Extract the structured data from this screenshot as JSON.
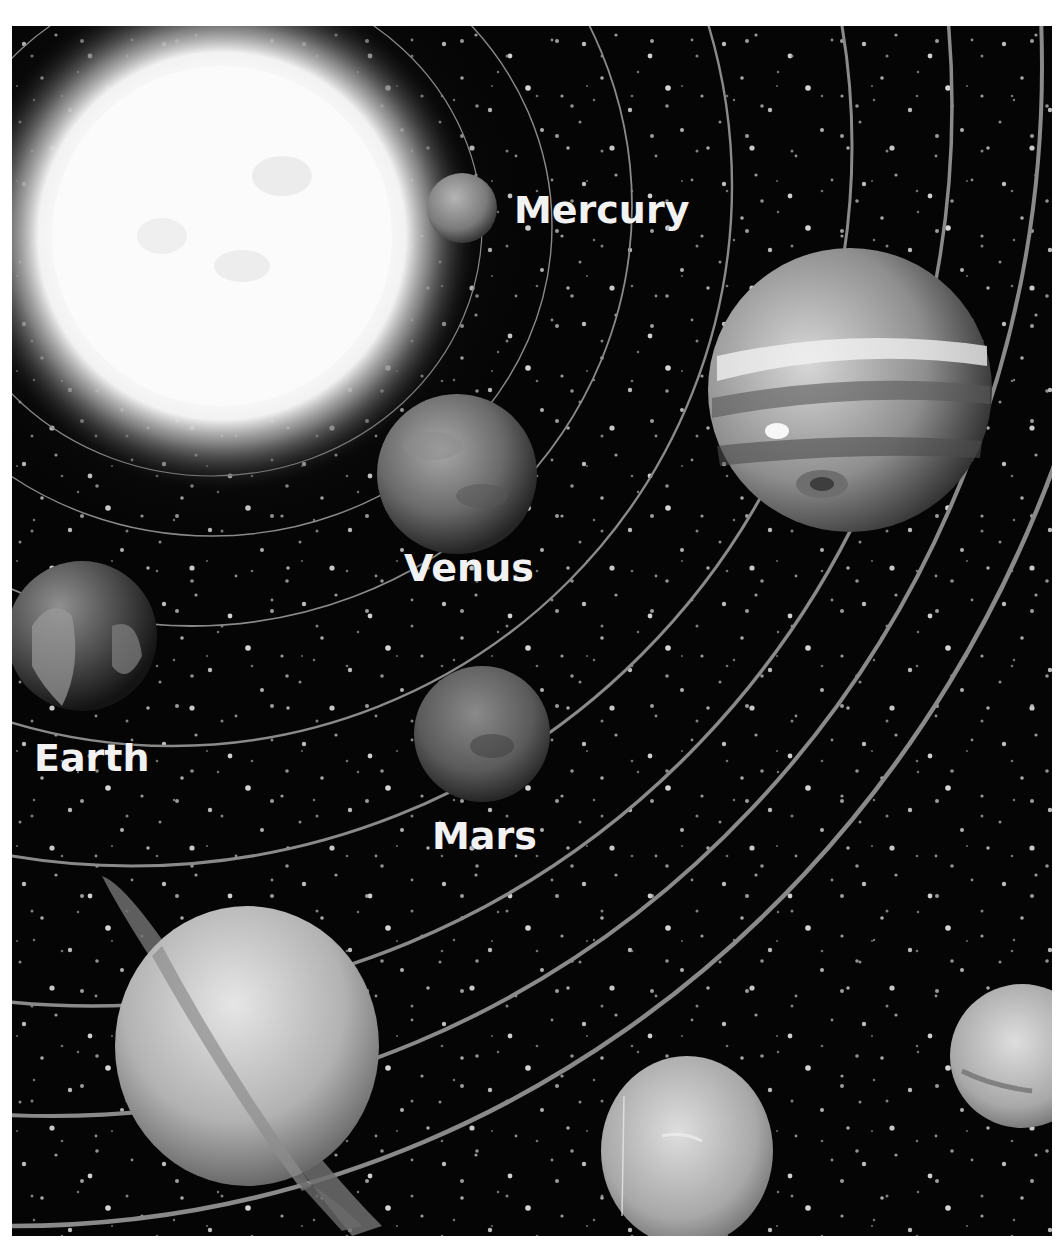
{
  "diagram": {
    "colors": {
      "background": "#050505",
      "orbit": "#8a8a8a",
      "label": "#f2f2f2",
      "frame_margin": "#ffffff"
    },
    "labels": {
      "mercury": "Mercury",
      "venus": "Venus",
      "earth": "Earth",
      "mars": "Mars"
    },
    "bodies": [
      {
        "name": "Sun",
        "labeled": false
      },
      {
        "name": "Mercury",
        "labeled": true
      },
      {
        "name": "Venus",
        "labeled": true
      },
      {
        "name": "Earth",
        "labeled": true
      },
      {
        "name": "Mars",
        "labeled": true
      },
      {
        "name": "Jupiter",
        "labeled": false
      },
      {
        "name": "Saturn",
        "labeled": false
      },
      {
        "name": "Uranus",
        "labeled": false
      },
      {
        "name": "Neptune",
        "labeled": false
      }
    ]
  }
}
